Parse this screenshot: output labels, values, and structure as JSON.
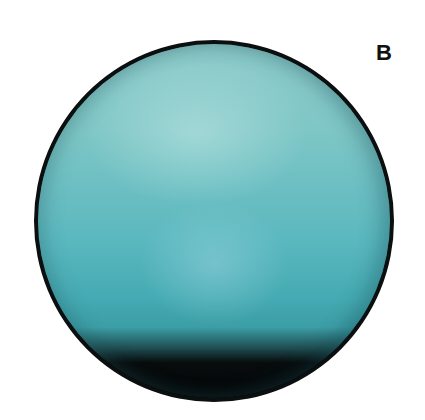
{
  "figure": {
    "panel_label": "B",
    "colors": {
      "disk_light": "#8fcccb",
      "disk_mid": "#5bb8bf",
      "disk_dark": "#3c9ea6",
      "shadow": "#050708",
      "outline": "#0b0f10",
      "background": "#ffffff"
    }
  }
}
